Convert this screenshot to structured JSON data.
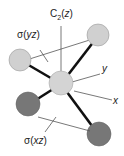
{
  "diagram": {
    "labels": {
      "axis_c2_prefix": "C",
      "axis_c2_sub": "2",
      "axis_c2_paren_open": "(",
      "axis_c2_var": "z",
      "axis_c2_paren_close": ")",
      "plane_yz_sigma": "σ",
      "plane_yz_paren_open": "(",
      "plane_yz_var": "yz",
      "plane_yz_paren_close": ")",
      "plane_xz_sigma": "σ",
      "plane_xz_paren_open": "(",
      "plane_xz_var": "xz",
      "plane_xz_paren_close": ")",
      "axis_y": "y",
      "axis_x": "x"
    },
    "atoms": [
      {
        "name": "central",
        "color": "#d0d0d0"
      },
      {
        "name": "upper-left",
        "color": "#d0d0d0"
      },
      {
        "name": "upper-right",
        "color": "#d0d0d0"
      },
      {
        "name": "lower-left",
        "color": "#777777"
      },
      {
        "name": "lower-right",
        "color": "#777777"
      }
    ]
  }
}
